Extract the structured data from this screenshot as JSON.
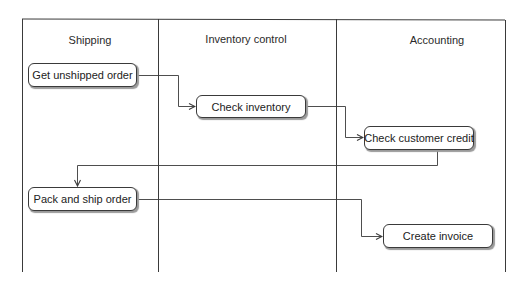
{
  "diagram": {
    "type": "swimlane-flowchart",
    "lanes": [
      {
        "id": "shipping",
        "title": "Shipping"
      },
      {
        "id": "inventory",
        "title": "Inventory control"
      },
      {
        "id": "accounting",
        "title": "Accounting"
      }
    ],
    "nodes": [
      {
        "id": "n1",
        "label": "Get unshipped order",
        "lane": "shipping"
      },
      {
        "id": "n2",
        "label": "Check inventory",
        "lane": "inventory"
      },
      {
        "id": "n3",
        "label": "Check customer credit",
        "lane": "accounting"
      },
      {
        "id": "n4",
        "label": "Pack and ship order",
        "lane": "shipping"
      },
      {
        "id": "n5",
        "label": "Create invoice",
        "lane": "accounting"
      }
    ],
    "edges": [
      {
        "from": "n1",
        "to": "n2"
      },
      {
        "from": "n2",
        "to": "n3"
      },
      {
        "from": "n3",
        "to": "n4"
      },
      {
        "from": "n4",
        "to": "n5"
      }
    ],
    "colors": {
      "line": "#3a3a3a",
      "background": "#ffffff",
      "shadow": "#9a9a9a"
    }
  }
}
